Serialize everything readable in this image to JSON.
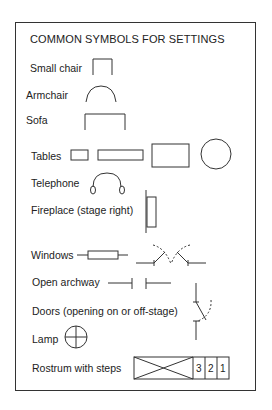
{
  "title": "COMMON SYMBOLS FOR SETTINGS",
  "items": [
    {
      "label": "Small chair",
      "symbol": "small-chair"
    },
    {
      "label": "Armchair",
      "symbol": "armchair"
    },
    {
      "label": "Sofa",
      "symbol": "sofa"
    },
    {
      "label": "Tables",
      "symbol": "tables"
    },
    {
      "label": "Telephone",
      "symbol": "telephone"
    },
    {
      "label": "Fireplace (stage right)",
      "symbol": "fireplace"
    },
    {
      "label": "Windows",
      "symbol": "windows"
    },
    {
      "label": "Open archway",
      "symbol": "archway"
    },
    {
      "label": "Doors (opening on or off-stage)",
      "symbol": "doors"
    },
    {
      "label": "Lamp",
      "symbol": "lamp"
    },
    {
      "label": "Rostrum with steps",
      "symbol": "rostrum"
    }
  ],
  "rostrum_steps": [
    "3",
    "2",
    "1"
  ]
}
